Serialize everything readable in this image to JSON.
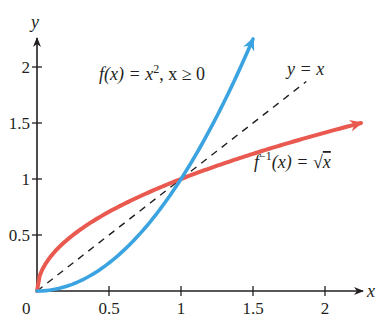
{
  "chart_data": {
    "type": "line",
    "title": "",
    "xlabel": "x",
    "ylabel": "y",
    "xlim": [
      0,
      2.25
    ],
    "ylim": [
      0,
      2.3
    ],
    "grid": false,
    "legend": "none (inline annotations)",
    "x_ticks": [
      0,
      0.5,
      1,
      1.5,
      2
    ],
    "x_tick_labels": [
      "0",
      "0.5",
      "1",
      "1.5",
      "2"
    ],
    "y_ticks": [
      0.5,
      1,
      1.5,
      2
    ],
    "y_tick_labels": [
      "0.5",
      "1",
      "1.5",
      "2"
    ],
    "origin_label": "0",
    "series": [
      {
        "name": "f(x) = x², x ≥ 0",
        "color": "#3ba3e0",
        "style": "solid",
        "arrow_end": true,
        "x": [
          0,
          0.25,
          0.5,
          0.75,
          1,
          1.25,
          1.5
        ],
        "y": [
          0,
          0.0625,
          0.25,
          0.5625,
          1,
          1.5625,
          2.25
        ]
      },
      {
        "name": "f⁻¹(x) = √x",
        "color": "#e9594f",
        "style": "solid",
        "arrow_end": true,
        "x": [
          0,
          0.0625,
          0.25,
          0.5,
          1,
          1.5,
          2,
          2.25
        ],
        "y": [
          0,
          0.25,
          0.5,
          0.7071,
          1,
          1.2247,
          1.4142,
          1.5
        ]
      },
      {
        "name": "y = x",
        "color": "#231f20",
        "style": "dashed",
        "arrow_end": false,
        "x": [
          0,
          1.87
        ],
        "y": [
          0,
          1.87
        ]
      }
    ],
    "annotations": [
      {
        "text": "f(x) = x², x ≥ 0",
        "near": [
          0.43,
          1.88
        ]
      },
      {
        "text": "y = x",
        "near": [
          1.72,
          2.0
        ]
      },
      {
        "text": "f⁻¹(x) = √x",
        "near": [
          1.57,
          0.95
        ]
      }
    ],
    "intersection_points": [
      [
        0,
        0
      ],
      [
        1,
        1
      ]
    ]
  },
  "labels": {
    "x_axis": "x",
    "y_axis": "y",
    "origin": "0",
    "f_label_main": "f(x) = x",
    "f_label_sup": "2",
    "f_label_cond": ", x ≥ 0",
    "identity_label": "y = x",
    "inv_label_f": "f",
    "inv_label_sup": "−1",
    "inv_label_rest": "(x) = ",
    "inv_label_sqrt": "√",
    "inv_label_x": "x"
  }
}
